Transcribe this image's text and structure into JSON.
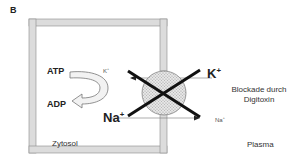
{
  "panel_label": "B",
  "labels": {
    "atp": "ATP",
    "adp": "ADP",
    "k_inner": "K",
    "k_inner_charge": "+",
    "na_inner": "Na",
    "na_inner_charge": "+",
    "k_outer": "K",
    "k_outer_charge": "+",
    "na_outer": "Na",
    "na_outer_charge": "+",
    "blockade": "Blockade durch Digitoxin",
    "cytosol": "Zytosol",
    "plasma": "Plasma"
  },
  "colors": {
    "membrane_fill": "#dcdcdc",
    "membrane_stroke": "#8a8a8a",
    "pump_fill": "#d4d4d4",
    "cross": "#111111",
    "arrow": "#555555"
  }
}
